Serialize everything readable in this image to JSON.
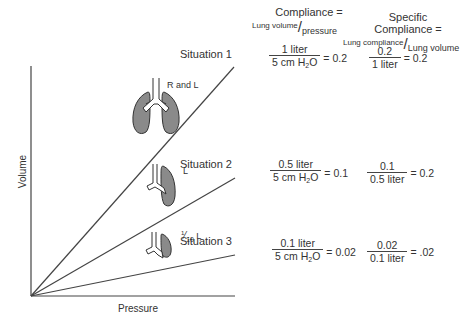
{
  "header": {
    "compliance": {
      "title": "Compliance =",
      "numerator": "Lung volume",
      "slash": "/",
      "denominator": "pressure"
    },
    "specific_compliance": {
      "title_line1": "Specific",
      "title_line2": "Compliance =",
      "numerator": "Lung compliance",
      "slash": "/",
      "denominator": "Lung volume"
    }
  },
  "axes": {
    "x_label": "Pressure",
    "y_label": "Volume"
  },
  "situations": [
    {
      "label": "Situation 1",
      "lung_label": "R and L",
      "compliance": {
        "numerator": "1 liter",
        "denominator_text": "5 cm H",
        "denominator_sub": "2",
        "denominator_tail": "O",
        "result": "= 0.2"
      },
      "specific": {
        "numerator": "0.2",
        "denominator": "1 liter",
        "result": "= 0.2"
      }
    },
    {
      "label": "Situation 2",
      "lung_label": "L",
      "compliance": {
        "numerator": "0.5 liter",
        "denominator_text": "5 cm H",
        "denominator_sub": "2",
        "denominator_tail": "O",
        "result": "= 0.1"
      },
      "specific": {
        "numerator": "0.1",
        "denominator": "0.5 liter",
        "result": "= 0.2"
      }
    },
    {
      "label": "Situation 3",
      "lung_label_sup": "1",
      "lung_label_sub": "10",
      "lung_label_tail": " L",
      "compliance": {
        "numerator": "0.1 liter",
        "denominator_text": "5 cm H",
        "denominator_sub": "2",
        "denominator_tail": "O",
        "result": "= 0.02"
      },
      "specific": {
        "numerator": "0.02",
        "denominator": "0.1 liter",
        "result": "= .02"
      }
    }
  ],
  "colors": {
    "lung_fill": "#8a8a8a",
    "line": "#333333",
    "text": "#333333"
  }
}
